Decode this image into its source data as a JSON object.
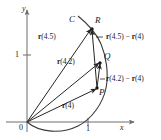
{
  "figure": {
    "kind": "vector-calculus-secant-diagram",
    "axes": {
      "x_axis_label": "x",
      "y_axis_label": "y",
      "origin_label": "0",
      "x_tick_label": "1",
      "y_tick_label": "1"
    },
    "curve_label": "C",
    "points": [
      {
        "name": "point-p",
        "label": "P"
      },
      {
        "name": "point-q",
        "label": "Q"
      },
      {
        "name": "point-r",
        "label": "R"
      }
    ],
    "vectors": [
      {
        "name": "position-vector-r4",
        "label": "r(4)",
        "bold": "r",
        "arg": "(4)"
      },
      {
        "name": "position-vector-r42",
        "label": "r(4.2)",
        "bold": "r",
        "arg": "(4.2)"
      },
      {
        "name": "position-vector-r45",
        "label": "r(4.5)",
        "bold": "r",
        "arg": "(4.5)"
      }
    ],
    "secants": [
      {
        "name": "secant-label-r42-minus-r4",
        "label": "r(4.2) − r(4)"
      },
      {
        "name": "secant-label-r45-minus-r4",
        "label": "r(4.5) − r(4)"
      }
    ],
    "colors": {
      "ink": "#1a1a1a",
      "axis": "#6d6d6d",
      "curve": "#3a3a3a",
      "background": "#ffffff"
    }
  },
  "chart_data": {
    "type": "scatter",
    "title": "",
    "xlabel": "x",
    "ylabel": "y",
    "grid": false,
    "legend": "none",
    "xlim": [
      -0.35,
      1.9
    ],
    "ylim": [
      -0.35,
      2.4
    ],
    "x_ticks": [
      1
    ],
    "y_ticks": [
      1
    ],
    "annotations": [
      "C",
      "P",
      "Q",
      "R",
      "r(4)",
      "r(4.2)",
      "r(4.5)",
      "r(4.2) − r(4)",
      "r(4.5) − r(4)",
      "0",
      "1",
      "x",
      "y"
    ],
    "points": [
      {
        "label": "P",
        "x": 1.14,
        "y": 0.57,
        "note": "tip of r(4)"
      },
      {
        "label": "Q",
        "x": 1.18,
        "y": 1.14,
        "note": "tip of r(4.2)"
      },
      {
        "label": "R",
        "x": 1.03,
        "y": 1.9,
        "note": "tip of r(4.5)"
      },
      {
        "label": "0",
        "x": 0.0,
        "y": 0.0,
        "note": "origin / tail of all position vectors"
      }
    ],
    "series": [
      {
        "name": "curve-C",
        "kind": "parametric-curve",
        "x": [
          0.0,
          0.28,
          0.62,
          0.93,
          1.12,
          1.22,
          1.2,
          1.18,
          1.13,
          1.03,
          0.88
        ],
        "y": [
          0.0,
          -0.17,
          -0.18,
          -0.03,
          0.22,
          0.55,
          0.85,
          1.14,
          1.5,
          1.9,
          2.2
        ]
      },
      {
        "name": "position-vector-r4",
        "kind": "arrow",
        "x": [
          0.0,
          1.14
        ],
        "y": [
          0.0,
          0.57
        ]
      },
      {
        "name": "position-vector-r42",
        "kind": "arrow",
        "x": [
          0.0,
          1.18
        ],
        "y": [
          0.0,
          1.14
        ]
      },
      {
        "name": "position-vector-r45",
        "kind": "arrow",
        "x": [
          0.0,
          1.03
        ],
        "y": [
          0.0,
          1.9
        ]
      },
      {
        "name": "secant-vector-PQ",
        "kind": "arrow",
        "x": [
          1.14,
          1.18
        ],
        "y": [
          0.57,
          1.14
        ]
      },
      {
        "name": "secant-vector-PR",
        "kind": "arrow",
        "x": [
          1.14,
          1.03
        ],
        "y": [
          0.57,
          1.9
        ]
      }
    ]
  }
}
